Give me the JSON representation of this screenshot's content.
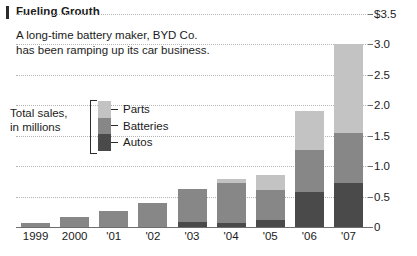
{
  "header": {
    "title": "Fueling Grouth",
    "accent_color": "#2b2b2b"
  },
  "subtitle": {
    "line1": "A long-time battery maker, BYD Co.",
    "line2": "has been ramping up its car business."
  },
  "legend": {
    "caption_line1": "Total sales,",
    "caption_line2": "in millions",
    "items": [
      {
        "label": "Parts",
        "color": "#c3c3c3"
      },
      {
        "label": "Batteries",
        "color": "#878787"
      },
      {
        "label": "Autos",
        "color": "#4a4a4a"
      }
    ]
  },
  "chart_data": {
    "type": "bar",
    "stacked": true,
    "title": "Fueling Grouth",
    "subtitle": "A long-time battery maker, BYD Co. has been ramping up its car business.",
    "xlabel": "",
    "ylabel": "Total sales, in millions",
    "ylim": [
      0,
      3.5
    ],
    "ytick_labels": [
      "$3.5",
      "3.0",
      "2.5",
      "2.0",
      "1.5",
      "1.0",
      "0.5",
      "0"
    ],
    "ytick_values": [
      3.5,
      3.0,
      2.5,
      2.0,
      1.5,
      1.0,
      0.5,
      0
    ],
    "grid": true,
    "legend_position": "inside-left",
    "categories": [
      "1999",
      "2000",
      "'01",
      "'02",
      "'03",
      "'04",
      "'05",
      "'06",
      "'07"
    ],
    "series": [
      {
        "name": "Autos",
        "color": "#4a4a4a",
        "values": [
          0.0,
          0.0,
          0.0,
          0.0,
          0.09,
          0.06,
          0.11,
          0.58,
          0.73
        ]
      },
      {
        "name": "Batteries",
        "color": "#878787",
        "values": [
          0.07,
          0.17,
          0.26,
          0.39,
          0.53,
          0.66,
          0.5,
          0.69,
          0.82
        ]
      },
      {
        "name": "Parts",
        "color": "#c3c3c3",
        "values": [
          0.0,
          0.0,
          0.0,
          0.0,
          0.0,
          0.07,
          0.25,
          0.63,
          1.45
        ]
      }
    ],
    "totals": [
      0.07,
      0.17,
      0.26,
      0.39,
      0.62,
      0.79,
      0.86,
      1.9,
      3.0
    ]
  }
}
